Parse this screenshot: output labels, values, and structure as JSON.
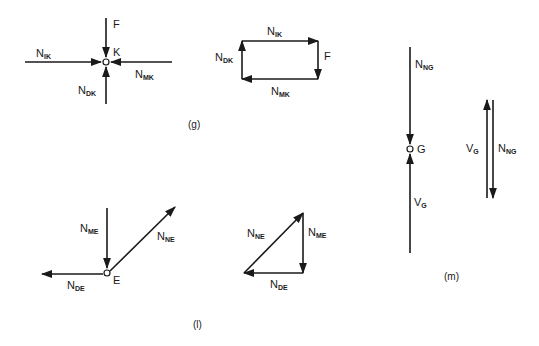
{
  "figure": {
    "panels": [
      {
        "id": "g",
        "caption": "(g)",
        "free_body": {
          "node": "K",
          "forces": [
            {
              "name": "F",
              "main": "F",
              "sub": "",
              "direction": "down, into node"
            },
            {
              "name": "N_IK",
              "main": "N",
              "sub": "IK",
              "direction": "right, into node"
            },
            {
              "name": "N_MK",
              "main": "N",
              "sub": "MK",
              "direction": "left, into node"
            },
            {
              "name": "N_DK",
              "main": "N",
              "sub": "DK",
              "direction": "up, into node"
            }
          ]
        },
        "force_polygon": {
          "shape": "rectangle",
          "sides": [
            {
              "name": "N_IK",
              "main": "N",
              "sub": "IK"
            },
            {
              "name": "F",
              "main": "F",
              "sub": ""
            },
            {
              "name": "N_MK",
              "main": "N",
              "sub": "MK"
            },
            {
              "name": "N_DK",
              "main": "N",
              "sub": "DK"
            }
          ]
        }
      },
      {
        "id": "l",
        "caption": "(l)",
        "free_body": {
          "node": "E",
          "forces": [
            {
              "name": "N_ME",
              "main": "N",
              "sub": "ME",
              "direction": "down, into node"
            },
            {
              "name": "N_NE",
              "main": "N",
              "sub": "NE",
              "direction": "up-right, away from node"
            },
            {
              "name": "N_DE",
              "main": "N",
              "sub": "DE",
              "direction": "left, away from node"
            }
          ]
        },
        "force_polygon": {
          "shape": "triangle",
          "sides": [
            {
              "name": "N_NE",
              "main": "N",
              "sub": "NE"
            },
            {
              "name": "N_ME",
              "main": "N",
              "sub": "ME"
            },
            {
              "name": "N_DE",
              "main": "N",
              "sub": "DE"
            }
          ]
        }
      },
      {
        "id": "m",
        "caption": "(m)",
        "free_body": {
          "node": "G",
          "forces": [
            {
              "name": "N_NG",
              "main": "N",
              "sub": "NG",
              "direction": "down, into node"
            },
            {
              "name": "V_G",
              "main": "V",
              "sub": "G",
              "direction": "up, into node"
            }
          ]
        },
        "force_polygon": {
          "shape": "collinear",
          "sides": [
            {
              "name": "V_G",
              "main": "V",
              "sub": "G"
            },
            {
              "name": "N_NG",
              "main": "N",
              "sub": "NG"
            }
          ]
        }
      }
    ]
  }
}
